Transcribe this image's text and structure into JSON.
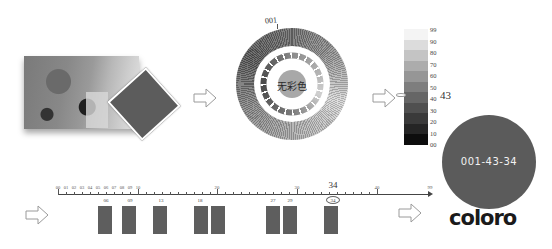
{
  "step1": {
    "photo_alt": "photo of plants and objects",
    "swatch_color": "#5c5c5c"
  },
  "arrows": [
    {
      "icon": "right-arrow-outline-icon"
    },
    {
      "icon": "right-arrow-outline-icon"
    },
    {
      "icon": "right-arrow-outline-icon"
    },
    {
      "icon": "right-arrow-outline-icon"
    }
  ],
  "hue_wheel": {
    "top_label": "001",
    "center_label": "无彩色",
    "center_color": "#a8a8a8"
  },
  "lightness_scale": {
    "labels": [
      "99",
      "90",
      "80",
      "70",
      "60",
      "50",
      "40",
      "30",
      "20",
      "10",
      "00"
    ],
    "colors": [
      "#f4f4f4",
      "#dcdcdc",
      "#c4c4c4",
      "#acacac",
      "#969696",
      "#7e7e7e",
      "#666666",
      "#505050",
      "#3a3a3a",
      "#252525",
      "#0d0d0d"
    ],
    "selected_value": "43"
  },
  "chroma_ruler": {
    "small_labels": [
      "00",
      "01",
      "02",
      "03",
      "04",
      "05",
      "06",
      "07",
      "08",
      "09",
      "10"
    ],
    "major_labels": [
      "20",
      "30",
      "40",
      "99"
    ],
    "highlight_value": "34",
    "bars": [
      {
        "label": "06"
      },
      {
        "label": "09"
      },
      {
        "label": "13"
      },
      {
        "label": "18"
      },
      {
        "label": "27"
      },
      {
        "label": "29"
      },
      {
        "label": "34"
      }
    ]
  },
  "result": {
    "code": "001-43-34",
    "color": "#5b5b5b",
    "brand": "coloro"
  }
}
